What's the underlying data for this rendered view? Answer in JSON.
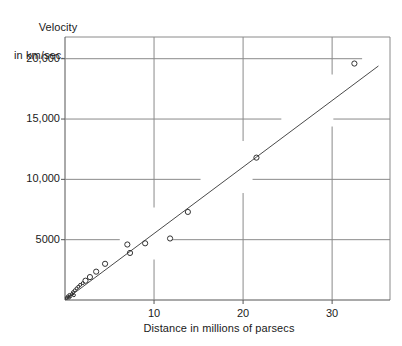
{
  "chart_data": {
    "type": "scatter",
    "title": "",
    "xlabel": "Distance in millions of parsecs",
    "ylabel_line1": "Velocity",
    "ylabel_line2": "in km/sec.",
    "xlim": [
      0,
      36.5
    ],
    "ylim": [
      0,
      21800
    ],
    "xticks": [
      10,
      20,
      30
    ],
    "xtick_labels": [
      "10",
      "20",
      "30"
    ],
    "yticks": [
      5000,
      10000,
      15000,
      20000
    ],
    "ytick_labels": [
      "5000",
      "10,000",
      "15,000",
      "20,000"
    ],
    "grid": true,
    "legend": "none",
    "marker": "open-circle",
    "series": [
      {
        "name": "galaxies",
        "points": [
          [
            0.2,
            170
          ],
          [
            0.3,
            290
          ],
          [
            0.45,
            200
          ],
          [
            0.5,
            420
          ],
          [
            0.6,
            300
          ],
          [
            0.8,
            500
          ],
          [
            0.9,
            650
          ],
          [
            1.0,
            400
          ],
          [
            1.1,
            800
          ],
          [
            1.3,
            960
          ],
          [
            1.5,
            1100
          ],
          [
            1.7,
            1250
          ],
          [
            2.0,
            1400
          ],
          [
            2.3,
            1600
          ],
          [
            2.8,
            1900
          ],
          [
            3.5,
            2350
          ],
          [
            4.5,
            3000
          ],
          [
            7.0,
            4600
          ],
          [
            7.3,
            3900
          ],
          [
            9.0,
            4700
          ],
          [
            11.8,
            5100
          ],
          [
            13.8,
            7300
          ],
          [
            21.5,
            11800
          ],
          [
            32.5,
            19600
          ]
        ]
      }
    ],
    "fit_line": {
      "name": "regression-line",
      "x_start": 0.0,
      "y_start": 0,
      "x_end": 35.2,
      "y_end": 19400
    }
  }
}
